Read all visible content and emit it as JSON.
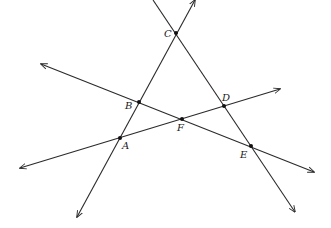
{
  "diagram": {
    "type": "geometry-lines",
    "points": [
      {
        "id": "A",
        "label": "A",
        "x": 120,
        "y": 138,
        "lx": 122,
        "ly": 149
      },
      {
        "id": "B",
        "label": "B",
        "x": 139,
        "y": 102,
        "lx": 125,
        "ly": 109
      },
      {
        "id": "C",
        "label": "C",
        "x": 176,
        "y": 33,
        "lx": 164,
        "ly": 37
      },
      {
        "id": "D",
        "label": "D",
        "x": 224,
        "y": 106,
        "lx": 222,
        "ly": 101
      },
      {
        "id": "E",
        "label": "E",
        "x": 251,
        "y": 146,
        "lx": 240,
        "ly": 158
      },
      {
        "id": "F",
        "label": "F",
        "x": 182,
        "y": 119,
        "lx": 177,
        "ly": 131
      }
    ],
    "lines": [
      {
        "name": "line-AC",
        "through": [
          "A",
          "B",
          "C"
        ],
        "x1": 77,
        "y1": 217,
        "x2": 195,
        "y2": 0,
        "arrow_start": true,
        "arrow_end": true
      },
      {
        "name": "line-CE",
        "through": [
          "C",
          "D",
          "E"
        ],
        "x1": 153,
        "y1": 0,
        "x2": 295,
        "y2": 212,
        "arrow_start": false,
        "arrow_end": true
      },
      {
        "name": "line-BE",
        "through": [
          "B",
          "F",
          "E"
        ],
        "x1": 41,
        "y1": 64,
        "x2": 314,
        "y2": 172,
        "arrow_start": true,
        "arrow_end": true
      },
      {
        "name": "line-AD",
        "through": [
          "A",
          "F",
          "D"
        ],
        "x1": 20,
        "y1": 168,
        "x2": 280,
        "y2": 89,
        "arrow_start": true,
        "arrow_end": true
      }
    ],
    "colors": {
      "line": "#2a2a2a",
      "point": "#111111",
      "background": "#ffffff"
    }
  }
}
